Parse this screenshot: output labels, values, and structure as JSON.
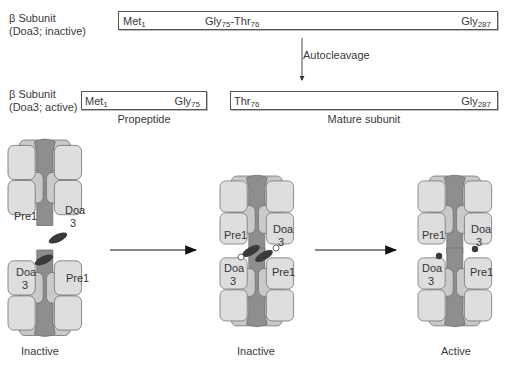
{
  "top_section": {
    "inactive_label_line1": "β Subunit",
    "inactive_label_line2": "(Doa3; inactive)",
    "inactive_bar": {
      "start": {
        "res": "Met",
        "num": "1"
      },
      "cleavage": {
        "res1": "Gly",
        "num1": "75",
        "sep": "-",
        "res2": "Thr",
        "num2": "76"
      },
      "end": {
        "res": "Gly",
        "num": "287"
      }
    },
    "arrow_label": "Autocleavage",
    "active_label_line1": "β Subunit",
    "active_label_line2": "(Doa3; active)",
    "propeptide_bar": {
      "start": {
        "res": "Met",
        "num": "1"
      },
      "end": {
        "res": "Gly",
        "num": "75"
      },
      "caption": "Propeptide"
    },
    "mature_bar": {
      "start": {
        "res": "Thr",
        "num": "76"
      },
      "end": {
        "res": "Gly",
        "num": "287"
      },
      "caption": "Mature subunit"
    }
  },
  "assembly": {
    "stages": [
      {
        "caption": "Inactive",
        "upper": {
          "left": "Pre1",
          "right_l1": "Doa",
          "right_l2": "3"
        },
        "lower": {
          "left_l1": "Doa",
          "left_l2": "3",
          "right": "Pre1"
        },
        "state": "separated half-proteasomes with propeptides"
      },
      {
        "caption": "Inactive",
        "upper": {
          "left": "Pre1",
          "right_l1": "Doa",
          "right_l2": "3"
        },
        "lower": {
          "left_l1": "Doa",
          "left_l2": "3",
          "right": "Pre1"
        },
        "state": "joined, propeptides present, open circles"
      },
      {
        "caption": "Active",
        "upper": {
          "left": "Pre1",
          "right_l1": "Doa",
          "right_l2": "3"
        },
        "lower": {
          "left_l1": "Doa",
          "left_l2": "3",
          "right": "Pre1"
        },
        "state": "joined, active sites filled circles"
      }
    ]
  },
  "colors": {
    "subunit_fill": "#dcdcdc",
    "subunit_stroke": "#6a6a6a",
    "back_fill": "#bdbdbd",
    "core_fill": "#8e8e8e",
    "propeptide_fill": "#3a3a3a",
    "active_site_fill": "#3a3a3a"
  }
}
